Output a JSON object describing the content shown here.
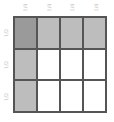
{
  "diagram": {
    "type": "fraction-area-model",
    "columns": 4,
    "rows": 3,
    "column_labels": [
      "1/4",
      "1/4",
      "1/4",
      "1/4"
    ],
    "row_labels": [
      "1/3",
      "1/3",
      "1/3"
    ],
    "colors": {
      "overlap": "#9a9a9a",
      "shaded": "#bdbdbd",
      "empty": "#ffffff",
      "grid_line": "#555555",
      "label": "#bbbbbb"
    },
    "cells": [
      [
        "overlap",
        "shaded",
        "shaded",
        "shaded"
      ],
      [
        "shaded",
        "empty",
        "empty",
        "empty"
      ],
      [
        "shaded",
        "empty",
        "empty",
        "empty"
      ]
    ]
  }
}
